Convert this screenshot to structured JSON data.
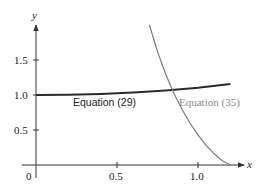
{
  "chart_data": {
    "type": "line",
    "title": "",
    "xlabel": "x",
    "ylabel": "y",
    "xlim": [
      0,
      1.25
    ],
    "ylim": [
      0,
      2.0
    ],
    "grid": false,
    "x_ticks": [
      "0",
      "0.5",
      "1.0"
    ],
    "y_ticks": [
      "0.5",
      "1.0",
      "1.5"
    ],
    "series": [
      {
        "name": "Equation (29)",
        "color": "#2a2a2a",
        "x": [
          0,
          0.2,
          0.4,
          0.6,
          0.8,
          1.0,
          1.2
        ],
        "y": [
          1.0,
          1.004,
          1.016,
          1.037,
          1.066,
          1.105,
          1.155
        ]
      },
      {
        "name": "Equation (35)",
        "color": "#7a7a7a",
        "x": [
          0.7,
          0.75,
          0.8,
          0.85,
          0.9,
          0.95,
          1.0,
          1.05,
          1.1,
          1.15,
          1.2
        ],
        "y": [
          2.0,
          1.62,
          1.3,
          1.03,
          0.8,
          0.6,
          0.43,
          0.28,
          0.16,
          0.06,
          0.0
        ]
      }
    ],
    "annotations": [
      {
        "text": "Equation (29)",
        "x": 0.26,
        "y": 0.93
      },
      {
        "text": "Equation (35)",
        "x": 0.88,
        "y": 0.93
      }
    ]
  },
  "labels": {
    "x_axis": "x",
    "y_axis": "y",
    "origin": "0",
    "xtick_05": "0.5",
    "xtick_10": "1.0",
    "ytick_05": "0.5",
    "ytick_10": "1.0",
    "ytick_15": "1.5",
    "series1": "Equation (29)",
    "series2": "Equation (35)"
  },
  "colors": {
    "axis": "#333333",
    "series1": "#2a2a2a",
    "series2": "#7a7a7a"
  }
}
